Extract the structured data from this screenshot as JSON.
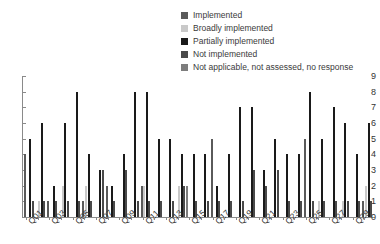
{
  "chart_data": {
    "type": "bar",
    "title": "",
    "xlabel": "",
    "ylabel": "",
    "ylim": [
      0,
      9
    ],
    "yticks": [
      0,
      1,
      2,
      3,
      4,
      5,
      6,
      7,
      8,
      9
    ],
    "grid": false,
    "legend_position": "top-right",
    "categories": [
      "Q01",
      "Q02",
      "Q03",
      "Q04",
      "Q05",
      "Q06",
      "Q07",
      "Q08",
      "Q09",
      "Q10",
      "Q11",
      "Q12",
      "Q13",
      "Q14",
      "Q15",
      "Q16",
      "Q17",
      "Q18",
      "Q19",
      "Q20",
      "Q21",
      "Q22",
      "Q23",
      "Q24",
      "Q25",
      "Q26",
      "Q27",
      "Q28",
      "Q29",
      "Q30"
    ],
    "tick_labels": [
      "Q01",
      "",
      "Q03",
      "",
      "Q05",
      "",
      "Q07",
      "",
      "Q09",
      "",
      "Q11",
      "",
      "Q13",
      "",
      "Q15",
      "",
      "Q17",
      "",
      "Q19",
      "",
      "Q21",
      "",
      "Q23",
      "",
      "Q25",
      "",
      "Q27",
      "",
      "Q29",
      ""
    ],
    "series": [
      {
        "name": "Implemented",
        "color": "#5a5a5a",
        "values": [
          4,
          0,
          1,
          0,
          0,
          1,
          0,
          2,
          0,
          0,
          2,
          0,
          0,
          0,
          0,
          0,
          5,
          0,
          0,
          0,
          0,
          0,
          0,
          0,
          5,
          0,
          0,
          0,
          0,
          1
        ]
      },
      {
        "name": "Broadly implemented",
        "color": "#c9c9c9",
        "values": [
          0,
          1,
          0,
          2,
          0,
          2,
          0,
          0,
          0,
          0,
          2,
          0,
          0,
          2,
          0,
          0,
          0,
          0,
          0,
          0,
          0,
          0,
          0,
          0,
          0,
          1,
          0,
          1,
          0,
          2
        ]
      },
      {
        "name": "Partially implemented",
        "color": "#1a1a1a",
        "values": [
          5,
          6,
          2,
          6,
          8,
          4,
          3,
          2,
          4,
          8,
          8,
          5,
          5,
          4,
          4,
          4,
          2,
          4,
          7,
          7,
          3,
          5,
          4,
          4,
          8,
          5,
          7,
          6,
          4,
          6
        ]
      },
      {
        "name": "Not implemented",
        "color": "#4a4a4a",
        "values": [
          1,
          1,
          1,
          1,
          1,
          1,
          3,
          1,
          3,
          1,
          1,
          1,
          1,
          2,
          1,
          1,
          1,
          1,
          1,
          3,
          2,
          3,
          1,
          1,
          1,
          1,
          1,
          1,
          1,
          1
        ]
      },
      {
        "name": "Not applicable, not assessed, no response",
        "color": "#7d7d7d",
        "values": [
          0,
          0,
          0,
          0,
          0,
          0,
          0,
          0,
          0,
          0,
          0,
          0,
          0,
          2,
          0,
          0,
          0,
          0,
          0,
          0,
          0,
          0,
          0,
          0,
          0,
          0,
          0,
          0,
          0,
          0
        ]
      }
    ]
  },
  "legend": {
    "items": [
      {
        "label": "Implemented",
        "color": "#5a5a5a"
      },
      {
        "label": "Broadly implemented",
        "color": "#c9c9c9"
      },
      {
        "label": "Partially implemented",
        "color": "#1a1a1a"
      },
      {
        "label": "Not implemented",
        "color": "#4a4a4a"
      },
      {
        "label": "Not applicable, not assessed, no response",
        "color": "#7d7d7d"
      }
    ]
  }
}
